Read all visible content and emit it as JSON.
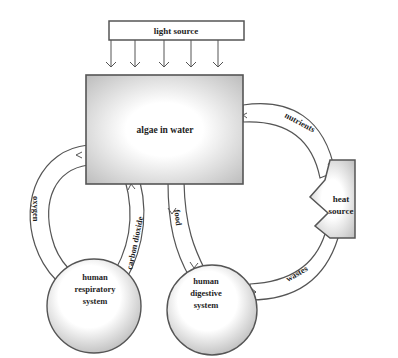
{
  "diagram": {
    "nodes": {
      "light_source": {
        "label": "light source"
      },
      "algae": {
        "label": "algae in water"
      },
      "heat_source": {
        "line1": "heat",
        "line2": "source"
      },
      "respiratory": {
        "line1": "human",
        "line2": "respiratory",
        "line3": "system"
      },
      "digestive": {
        "line1": "human",
        "line2": "digestive",
        "line3": "system"
      }
    },
    "flows": {
      "oxygen": "oxygen",
      "carbon_dioxide": "carbon dioxide",
      "food": "food",
      "wastes": "wastes",
      "nutrients": "nutrients"
    },
    "colors": {
      "stroke": "#555555",
      "shade": "#c8c8c8",
      "text": "#1e1e1e"
    }
  }
}
